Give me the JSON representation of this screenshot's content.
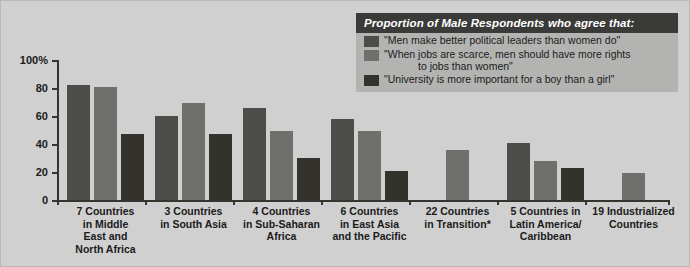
{
  "legend": {
    "title": "Proportion of Male Respondents who agree that:",
    "entries": [
      {
        "swatch": "#4c4c48",
        "text": "\"Men make better political leaders than women do\"",
        "cont": ""
      },
      {
        "swatch": "#6f706c",
        "text": "\"When jobs are scarce, men should have more rights",
        "cont": "to jobs than women\""
      },
      {
        "swatch": "#33322c",
        "text": "\"University is more important for a boy than a girl\"",
        "cont": ""
      }
    ]
  },
  "colors": {
    "background": "#cfd0cf",
    "legend_panel": "#b3b4b2",
    "legend_header": "#3a3a38",
    "series1": "#4c4c48",
    "series2": "#6f706c",
    "series3": "#33322c",
    "axis": "#35352f",
    "text": "#1b1b1b"
  },
  "chart_data": {
    "type": "bar",
    "title": "Proportion of Male Respondents who agree that:",
    "xlabel": "",
    "ylabel": "",
    "ylim": [
      0,
      100
    ],
    "yticks": [
      0,
      20,
      40,
      60,
      80,
      100
    ],
    "ytick_labels": [
      "0",
      "20",
      "40",
      "60",
      "80",
      "100%"
    ],
    "grid": false,
    "legend_position": "top-right",
    "categories": [
      "7 Countries in Middle East and North Africa",
      "3 Countries in South Asia",
      "4 Countries in Sub-Saharan Africa",
      "6 Countries in East Asia and the Pacific",
      "22 Countries in Transition*",
      "5 Countries in Latin America/ Caribbean",
      "19 Industrialized Countries"
    ],
    "category_lines": [
      [
        "7 Countries",
        "in Middle",
        "East and",
        "North Africa"
      ],
      [
        "3 Countries",
        "in South Asia"
      ],
      [
        "4 Countries",
        "in Sub-Saharan",
        "Africa"
      ],
      [
        "6 Countries",
        "in East Asia",
        "and the Pacific"
      ],
      [
        "22 Countries",
        "in Transition*"
      ],
      [
        "5 Countries in",
        "Latin America/",
        "Caribbean"
      ],
      [
        "19 Industrialized",
        "Countries"
      ]
    ],
    "series": [
      {
        "name": "\"Men make better political leaders than women do\"",
        "color": "#4c4c48",
        "values": [
          82,
          60,
          66,
          58,
          null,
          41,
          null
        ]
      },
      {
        "name": "\"When jobs are scarce, men should have more rights to jobs than women\"",
        "color": "#6f706c",
        "values": [
          81,
          69,
          49,
          49,
          36,
          28,
          19
        ]
      },
      {
        "name": "\"University is more important for a boy than a girl\"",
        "color": "#33322c",
        "values": [
          47,
          47,
          30,
          21,
          null,
          23,
          null
        ]
      }
    ]
  }
}
